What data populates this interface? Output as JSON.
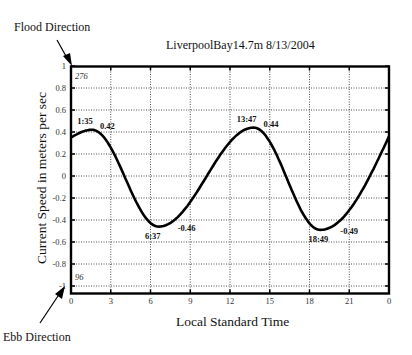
{
  "labels": {
    "flood_direction": "Flood Direction",
    "ebb_direction": "Ebb Direction",
    "top_direction_deg": "276",
    "bottom_direction_deg": "96"
  },
  "chart_data": {
    "type": "line",
    "title": "LiverpoolBay14.7m 8/13/2004",
    "xlabel": "Local Standard Time",
    "ylabel": "Current Speed in meters per sec",
    "xlim": [
      0,
      24
    ],
    "ylim": [
      -1.05,
      1
    ],
    "grid": true,
    "x_ticks": [
      0,
      3,
      6,
      9,
      12,
      15,
      18,
      21,
      24
    ],
    "x_tick_labels": [
      "0",
      "3",
      "6",
      "9",
      "12",
      "15",
      "18",
      "21",
      "0"
    ],
    "y_ticks": [
      1,
      0.8,
      0.6,
      0.4,
      0.2,
      0,
      -0.2,
      -0.4,
      -0.6,
      -0.8,
      -1
    ],
    "y_tick_labels": [
      "1",
      "0.8",
      "0.6",
      "0.4",
      "0.2",
      "0",
      "-0.2",
      "-0.4",
      "-0.6",
      "-0.8",
      "-1"
    ],
    "series": [
      {
        "name": "Current Speed",
        "x": [
          0,
          1.58,
          6.62,
          13.78,
          18.82,
          24
        ],
        "values": [
          0.35,
          0.42,
          -0.46,
          0.44,
          -0.49,
          0.36
        ]
      }
    ],
    "annotations": [
      {
        "time": "1:35",
        "value": "0.42",
        "x": 1.58,
        "y": 0.42
      },
      {
        "time": "6:37",
        "value": "-0.46",
        "x": 6.62,
        "y": -0.46
      },
      {
        "time": "13:47",
        "value": "0.44",
        "x": 13.78,
        "y": 0.44
      },
      {
        "time": "18:49",
        "value": "-0.49",
        "x": 18.82,
        "y": -0.49
      }
    ]
  }
}
